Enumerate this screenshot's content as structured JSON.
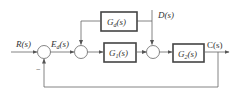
{
  "diagram": {
    "type": "block-diagram",
    "signals": {
      "input": "R(s)",
      "error": "E",
      "error_sub": "d",
      "error_suffix": "(s)",
      "disturbance": "D(s)",
      "output": "C(s)"
    },
    "blocks": {
      "gd": {
        "main": "G",
        "sub": "d",
        "suffix": "(s)"
      },
      "g1": {
        "main": "G",
        "sub": "1",
        "suffix": "(s)"
      },
      "g2": {
        "main": "G",
        "sub": "2",
        "suffix": "(s)"
      }
    },
    "summing_junctions": [
      {
        "id": "sum1",
        "signs": [
          "+",
          "−"
        ]
      },
      {
        "id": "sum2",
        "signs": [
          "+",
          "+"
        ]
      },
      {
        "id": "sum3",
        "signs": [
          "+",
          "+"
        ]
      }
    ],
    "feedback_sign": "−",
    "colors": {
      "line": "#666666",
      "block_border": "#444444",
      "text": "#333333"
    }
  }
}
